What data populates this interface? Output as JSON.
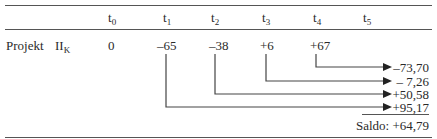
{
  "table": {
    "columns": [
      {
        "base": "t",
        "sub": "0"
      },
      {
        "base": "t",
        "sub": "1"
      },
      {
        "base": "t",
        "sub": "2"
      },
      {
        "base": "t",
        "sub": "3"
      },
      {
        "base": "t",
        "sub": "4"
      },
      {
        "base": "t",
        "sub": "5"
      }
    ],
    "row": {
      "label": "Projekt",
      "name_base": "II",
      "name_sub": "K",
      "values": [
        "0",
        "–65",
        "–38",
        "+6",
        "+67",
        ""
      ]
    },
    "compounded": [
      "–73,70",
      "– 7,26",
      "+50,58",
      "+95,17"
    ],
    "saldo": "Saldo: +64,79"
  }
}
